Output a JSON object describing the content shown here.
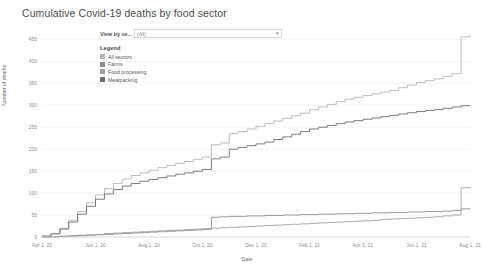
{
  "title": "Cumulative Covid-19 deaths by food sector",
  "parameter": {
    "label": "View by se...",
    "value": "(All)",
    "arrow": "▾"
  },
  "legend": {
    "title": "Legend",
    "items": [
      {
        "label": "All sectors",
        "color": "#b6b6b6"
      },
      {
        "label": "Farms",
        "color": "#8f8f8f"
      },
      {
        "label": "Food processing",
        "color": "#a3a3a3"
      },
      {
        "label": "Meatpacking",
        "color": "#6e6e6e"
      }
    ]
  },
  "chart_data": {
    "type": "line",
    "title": "Cumulative Covid-19 deaths by food sector",
    "xlabel": "Date",
    "ylabel": "Number of deaths",
    "ylim": [
      0,
      460
    ],
    "yticks": [
      0,
      50,
      100,
      150,
      200,
      250,
      300,
      350,
      400,
      450
    ],
    "ytick_labels": [
      "0",
      "50",
      "100",
      "150",
      "200",
      "250",
      "300",
      "350",
      "400",
      "450"
    ],
    "grid": true,
    "legend_position": "top-left-inside",
    "xticks": [
      "Apr 1, 20",
      "Jun 1, 20",
      "Aug 1, 20",
      "Oct 1, 20",
      "Dec 1, 20",
      "Feb 1, 21",
      "Apr 1, 21",
      "Jun 1, 21",
      "Aug 1, 21"
    ],
    "x": [
      0,
      1,
      2,
      3,
      4,
      5,
      6,
      7,
      8,
      9,
      10,
      11,
      12,
      13,
      14,
      15,
      16,
      17,
      18,
      19,
      20,
      21,
      22,
      23,
      24,
      25,
      26,
      27,
      28,
      29,
      30,
      31,
      32,
      33,
      34,
      35,
      36,
      37,
      38,
      39,
      40,
      41,
      42,
      43,
      44,
      45,
      46,
      47,
      48
    ],
    "series": [
      {
        "name": "All sectors",
        "color": "#b6b6b6",
        "values": [
          2,
          8,
          20,
          38,
          58,
          78,
          96,
          110,
          122,
          132,
          140,
          146,
          152,
          158,
          163,
          168,
          172,
          177,
          182,
          210,
          214,
          236,
          240,
          246,
          252,
          258,
          264,
          270,
          276,
          282,
          290,
          296,
          302,
          308,
          314,
          318,
          322,
          326,
          330,
          334,
          340,
          346,
          352,
          356,
          360,
          366,
          372,
          456,
          460
        ]
      },
      {
        "name": "Meatpacking",
        "color": "#6e6e6e",
        "values": [
          2,
          7,
          18,
          34,
          52,
          70,
          86,
          98,
          108,
          116,
          122,
          127,
          131,
          135,
          139,
          143,
          146,
          150,
          154,
          178,
          182,
          200,
          204,
          208,
          212,
          216,
          222,
          228,
          234,
          240,
          246,
          250,
          254,
          258,
          262,
          265,
          268,
          271,
          274,
          277,
          280,
          283,
          286,
          288,
          290,
          293,
          296,
          299,
          300
        ]
      },
      {
        "name": "Food processing",
        "color": "#a3a3a3",
        "values": [
          0,
          1,
          2,
          3,
          4,
          5,
          6,
          8,
          9,
          10,
          11,
          12,
          13,
          14,
          15,
          16,
          17,
          18,
          19,
          20,
          21,
          22,
          23,
          24,
          25,
          26,
          27,
          28,
          29,
          30,
          31,
          32,
          33,
          34,
          35,
          36,
          37,
          38,
          40,
          41,
          42,
          43,
          44,
          45,
          46,
          48,
          50,
          112,
          115
        ]
      },
      {
        "name": "Farms",
        "color": "#8f8f8f",
        "values": [
          0,
          0,
          1,
          2,
          3,
          4,
          5,
          6,
          7,
          8,
          9,
          10,
          11,
          12,
          13,
          14,
          15,
          16,
          17,
          45,
          46,
          47,
          47,
          48,
          48,
          49,
          49,
          50,
          50,
          51,
          51,
          52,
          52,
          53,
          53,
          54,
          54,
          55,
          55,
          56,
          56,
          57,
          57,
          58,
          58,
          59,
          60,
          64,
          65
        ]
      }
    ]
  }
}
